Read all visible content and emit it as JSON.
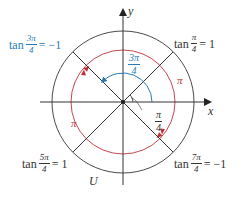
{
  "diagram": {
    "type": "unit-circle-tangent-periodicity",
    "colors": {
      "outer_circle": "#4a4a4a",
      "inner_arc": "#c0323a",
      "angle_arc": "#2a7bb5",
      "axes": "#333333",
      "lines": "#333333"
    },
    "axes": {
      "x_label": "x",
      "y_label": "y"
    },
    "circle_label": "U",
    "labels": {
      "top_right": {
        "prefix": "tan",
        "num": "π",
        "den": "4",
        "suffix": "= 1"
      },
      "top_left": {
        "prefix": "tan",
        "num": "3π",
        "den": "4",
        "suffix": "= −1"
      },
      "bottom_left": {
        "prefix": "tan",
        "num": "5π",
        "den": "4",
        "suffix": "= 1"
      },
      "bottom_right": {
        "prefix": "tan",
        "num": "7π",
        "den": "4",
        "suffix": "= −1"
      }
    },
    "angle_labels": {
      "three_pi_over_4": {
        "num": "3π",
        "den": "4"
      },
      "pi_over_4": {
        "num": "π",
        "den": "4"
      }
    },
    "arc_labels": {
      "right": "π",
      "left": "π"
    }
  }
}
